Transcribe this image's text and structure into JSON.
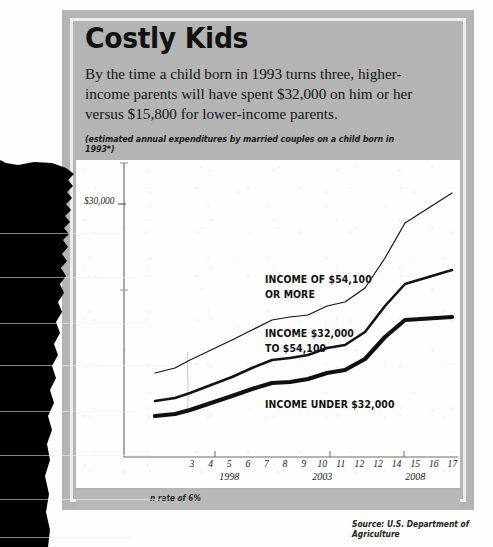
{
  "headline": {
    "title": "Costly Kids",
    "deck": "By the time a child born in 1993 turns three, higher-income parents will have spent $32,000 on him or her versus $15,800 for lower-income parents.",
    "subdeck": "(estimated annual expenditures by married couples on a child born in 1993*)"
  },
  "footnote": "n rate of 6%",
  "source": "Source: U.S. Department of Agriculture",
  "colors": {
    "panel_gray": "#b4b4b4",
    "band_gray": "#b9b9b9",
    "inner_border": "#ececec",
    "plot_white": "#fdfdfd",
    "ink": "#111111",
    "tear_black": "#000000"
  },
  "chart_data": {
    "type": "line",
    "title": "Costly Kids",
    "subtitle": "(estimated annual expenditures by married couples on a child born in 1993*)",
    "xlabel": "",
    "ylabel": "",
    "grid": false,
    "legend": "inline-annotations",
    "y_tick_labels": [
      "$30,000"
    ],
    "y_tick_values": [
      30000
    ],
    "x_categories": [
      "3",
      "4",
      "5",
      "6",
      "7",
      "8",
      "9",
      "10",
      "11",
      "12",
      "12",
      "14",
      "15",
      "16",
      "17"
    ],
    "x_year_markers": [
      {
        "label": "1998",
        "at_category": "5"
      },
      {
        "label": "2003",
        "at_category": "10"
      },
      {
        "label": "2008",
        "at_category": "15"
      }
    ],
    "series": [
      {
        "name": "INCOME OF $54,100 OR MORE",
        "label_lines": [
          "INCOME OF $54,100",
          "OR MORE"
        ],
        "stroke_width": 1.2,
        "values": [
          12900,
          13400,
          14200,
          15300,
          16400,
          17600,
          18900,
          20200,
          21700,
          23200,
          23500,
          25400,
          29200,
          32400,
          35500
        ]
      },
      {
        "name": "INCOME $32,000 TO $54,100",
        "label_lines": [
          "INCOME $32,000",
          "TO $54,100"
        ],
        "stroke_width": 2.6,
        "values": [
          9000,
          9500,
          10200,
          11000,
          11900,
          12900,
          13900,
          14300,
          15200,
          16300,
          16500,
          18400,
          22000,
          24100,
          25600
        ]
      },
      {
        "name": "INCOME UNDER $32,000",
        "label_lines": [
          "INCOME UNDER $32,000"
        ],
        "stroke_width": 4.2,
        "values": [
          6600,
          7000,
          7600,
          8300,
          9100,
          9900,
          10700,
          11000,
          11800,
          12700,
          12900,
          14600,
          17500,
          19300,
          20500
        ]
      }
    ],
    "annotations": [
      {
        "text": "$30,000",
        "kind": "y-axis-tick"
      },
      {
        "text": "n rate of 6%",
        "kind": "footnote-partially-obscured"
      },
      {
        "text": "Source: U.S. Department of Agriculture",
        "kind": "source"
      }
    ]
  }
}
